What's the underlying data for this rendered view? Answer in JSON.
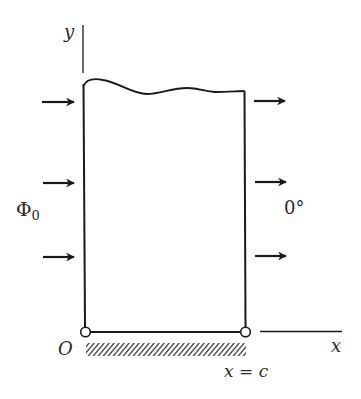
{
  "diagram": {
    "type": "semi-infinite strip heat conduction boundary diagram",
    "axes": {
      "y_label": "y",
      "x_label": "x",
      "origin_label": "O"
    },
    "boundaries": {
      "left": {
        "value_label": "Φ",
        "value_subscript": "0",
        "arrow_count": 3,
        "arrow_direction": "right"
      },
      "right": {
        "value_label": "0°",
        "arrow_count": 3,
        "arrow_direction": "right",
        "position_label": "x = c"
      },
      "bottom": {
        "type": "insulated (hatched)"
      },
      "top": {
        "type": "open (wavy break line)"
      }
    },
    "colors": {
      "line": "#1a1a1a",
      "background": "#ffffff"
    }
  }
}
